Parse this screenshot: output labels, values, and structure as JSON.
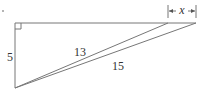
{
  "diagram": {
    "labels": {
      "vertical_leg": "5",
      "inner_hypotenuse": "13",
      "outer_hypotenuse": "15",
      "unknown_segment": "x"
    },
    "marks": {
      "right_angle": "top-left",
      "dot": "•"
    },
    "line_color": "#777777",
    "text_color": "#333333"
  }
}
